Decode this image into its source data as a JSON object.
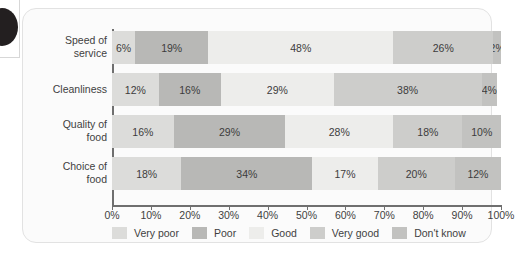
{
  "chart_data": {
    "type": "bar",
    "orientation": "horizontal",
    "stacked": true,
    "stack_mode": "percent",
    "title": "",
    "xlabel": "",
    "ylabel": "",
    "xlim": [
      0,
      100
    ],
    "grid": false,
    "legend_position": "bottom",
    "categories": [
      "Speed of service",
      "Cleanliness",
      "Quality of food",
      "Choice of food"
    ],
    "tick_labels": [
      "0%",
      "10%",
      "20%",
      "30%",
      "40%",
      "50%",
      "60%",
      "70%",
      "80%",
      "90%",
      "100%"
    ],
    "tick_values": [
      0,
      10,
      20,
      30,
      40,
      50,
      60,
      70,
      80,
      90,
      100
    ],
    "series": [
      {
        "name": "Very poor",
        "color": "#dcdcda",
        "values": [
          6,
          12,
          16,
          18
        ],
        "labels": [
          "6%",
          "12%",
          "16%",
          "18%"
        ]
      },
      {
        "name": "Poor",
        "color": "#b8b8b6",
        "values": [
          19,
          16,
          29,
          34
        ],
        "labels": [
          "19%",
          "16%",
          "29%",
          "34%"
        ]
      },
      {
        "name": "Good",
        "color": "#ededeb",
        "values": [
          48,
          29,
          28,
          17
        ],
        "labels": [
          "48%",
          "29%",
          "28%",
          "17%"
        ]
      },
      {
        "name": "Very good",
        "color": "#cdcdcb",
        "values": [
          26,
          38,
          18,
          20
        ],
        "labels": [
          "26%",
          "38%",
          "18%",
          "20%"
        ]
      },
      {
        "name": "Don't know",
        "color": "#c2c2c0",
        "values": [
          2,
          4,
          10,
          12
        ],
        "labels": [
          "2%",
          "4%",
          "10%",
          "12%"
        ]
      }
    ],
    "rows": [
      {
        "category": "Speed of service",
        "category_line1": "Speed of",
        "category_line2": "service",
        "segments": [
          {
            "series": "Very poor",
            "value": 6,
            "label": "6%"
          },
          {
            "series": "Poor",
            "value": 19,
            "label": "19%"
          },
          {
            "series": "Good",
            "value": 48,
            "label": "48%"
          },
          {
            "series": "Very good",
            "value": 26,
            "label": "26%"
          },
          {
            "series": "Don't know",
            "value": 2,
            "label": "2%"
          }
        ]
      },
      {
        "category": "Cleanliness",
        "category_line1": "Cleanliness",
        "category_line2": "",
        "segments": [
          {
            "series": "Very poor",
            "value": 12,
            "label": "12%"
          },
          {
            "series": "Poor",
            "value": 16,
            "label": "16%"
          },
          {
            "series": "Good",
            "value": 29,
            "label": "29%"
          },
          {
            "series": "Very good",
            "value": 38,
            "label": "38%"
          },
          {
            "series": "Don't know",
            "value": 4,
            "label": "4%"
          }
        ]
      },
      {
        "category": "Quality of food",
        "category_line1": "Quality of",
        "category_line2": "food",
        "segments": [
          {
            "series": "Very poor",
            "value": 16,
            "label": "16%"
          },
          {
            "series": "Poor",
            "value": 29,
            "label": "29%"
          },
          {
            "series": "Good",
            "value": 28,
            "label": "28%"
          },
          {
            "series": "Very good",
            "value": 18,
            "label": "18%"
          },
          {
            "series": "Don't know",
            "value": 10,
            "label": "10%"
          }
        ]
      },
      {
        "category": "Choice of food",
        "category_line1": "Choice of",
        "category_line2": "food",
        "segments": [
          {
            "series": "Very poor",
            "value": 18,
            "label": "18%"
          },
          {
            "series": "Poor",
            "value": 34,
            "label": "34%"
          },
          {
            "series": "Good",
            "value": 17,
            "label": "17%"
          },
          {
            "series": "Very good",
            "value": 20,
            "label": "20%"
          },
          {
            "series": "Don't know",
            "value": 12,
            "label": "12%"
          }
        ]
      }
    ],
    "legend": [
      {
        "label": "Very poor",
        "color": "#dcdcda"
      },
      {
        "label": "Poor",
        "color": "#b8b8b6"
      },
      {
        "label": "Good",
        "color": "#ededeb"
      },
      {
        "label": "Very good",
        "color": "#cdcdcb"
      },
      {
        "label": "Don't know",
        "color": "#c2c2c0"
      }
    ]
  },
  "page": {
    "card_background": "#fbfbfb",
    "card_border": "#e2e2e2",
    "axis_color": "#6f6f6f",
    "text_color": "#3f3f3f",
    "corner_mark_color": "#231f20"
  }
}
